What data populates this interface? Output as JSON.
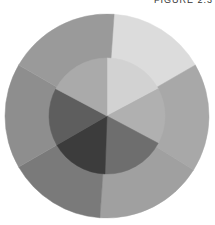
{
  "caption": "FIGURE 2.3",
  "wheel": {
    "center": [
      107,
      116
    ],
    "outer_radius": 102,
    "inner_radius": 58,
    "outer_segments": [
      {
        "start": -86,
        "end": -30,
        "color": "#dcdcdc"
      },
      {
        "start": -30,
        "end": 32,
        "color": "#a8a8a8"
      },
      {
        "start": 32,
        "end": 94,
        "color": "#a0a0a0"
      },
      {
        "start": 94,
        "end": 150,
        "color": "#7a7a7a"
      },
      {
        "start": 150,
        "end": 210,
        "color": "#8e8e8e"
      },
      {
        "start": 210,
        "end": 274,
        "color": "#9a9a9a"
      }
    ],
    "inner_segments": [
      {
        "start": -90,
        "end": -28,
        "color": "#d2d2d2"
      },
      {
        "start": -28,
        "end": 28,
        "color": "#b0b0b0"
      },
      {
        "start": 28,
        "end": 92,
        "color": "#6e6e6e"
      },
      {
        "start": 92,
        "end": 150,
        "color": "#3c3c3c"
      },
      {
        "start": 150,
        "end": 208,
        "color": "#5e5e5e"
      },
      {
        "start": 208,
        "end": 270,
        "color": "#aaaaaa"
      }
    ]
  }
}
